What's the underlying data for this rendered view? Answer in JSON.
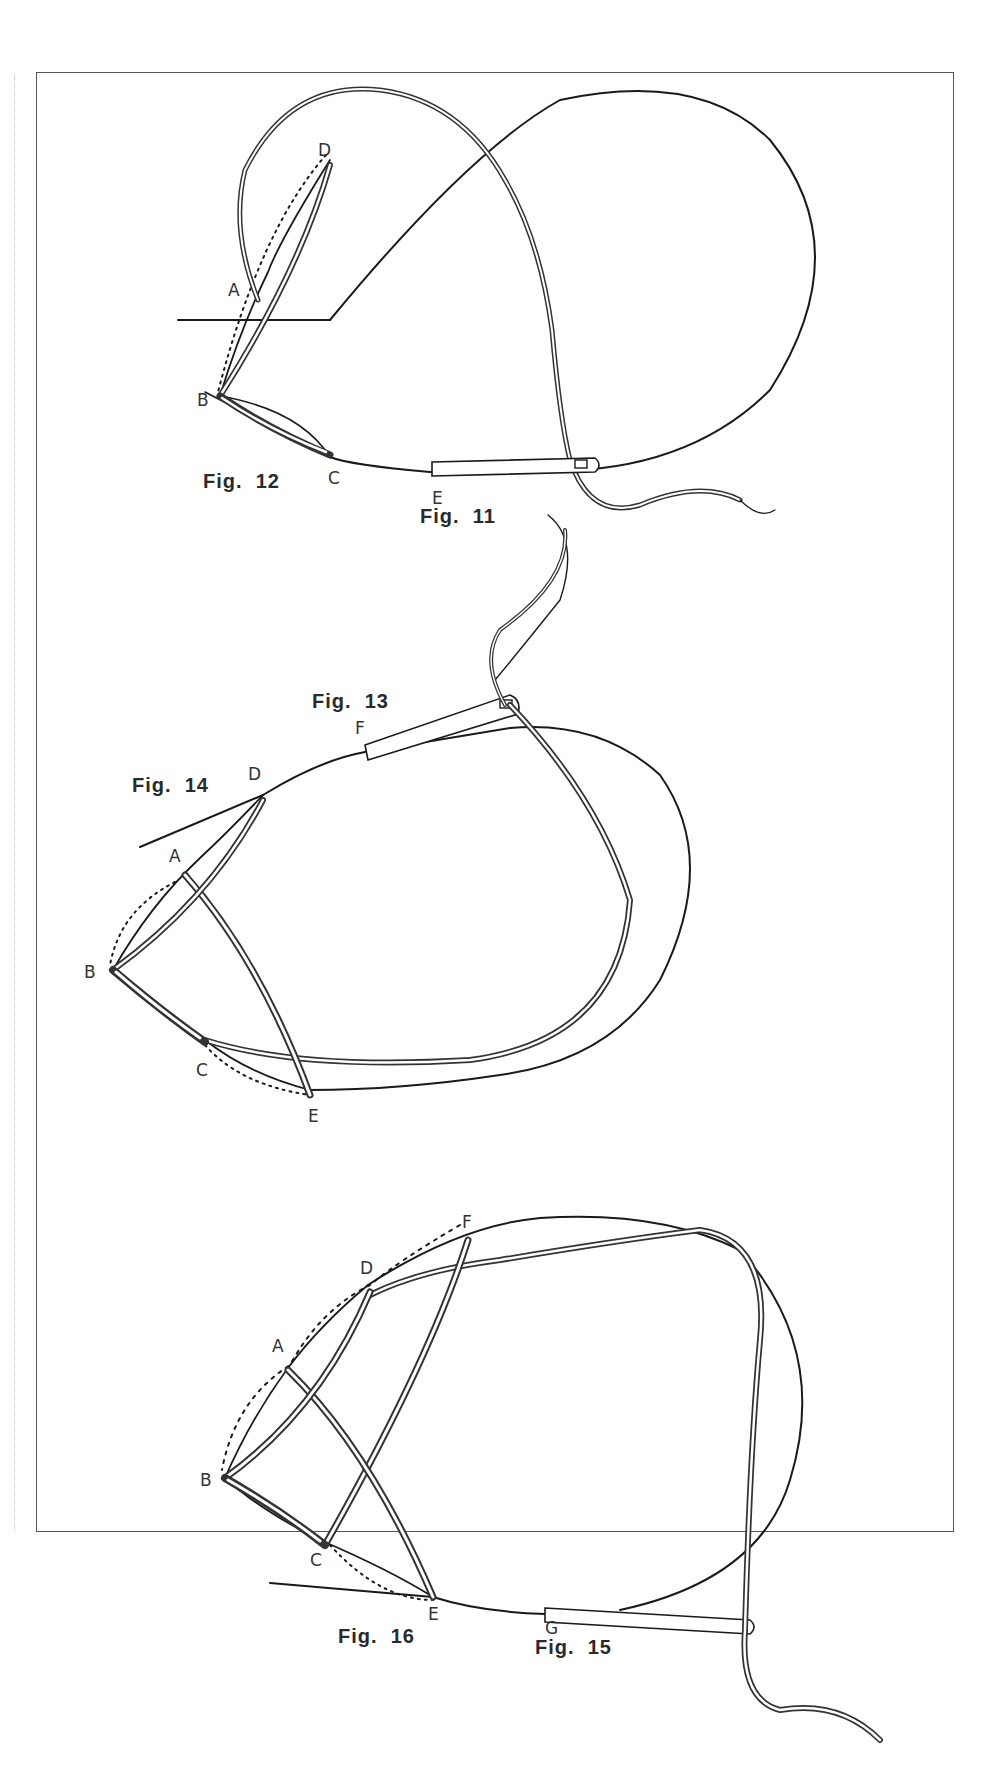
{
  "figures": [
    {
      "id": "fig11",
      "label": "Fig.  11"
    },
    {
      "id": "fig12",
      "label": "Fig.  12"
    },
    {
      "id": "fig13",
      "label": "Fig.  13"
    },
    {
      "id": "fig14",
      "label": "Fig.  14"
    },
    {
      "id": "fig15",
      "label": "Fig.  15"
    },
    {
      "id": "fig16",
      "label": "Fig.  16"
    }
  ],
  "points": {
    "top": {
      "A": "A",
      "B": "B",
      "C": "C",
      "D": "D",
      "E": "E"
    },
    "middle": {
      "A": "A",
      "B": "B",
      "C": "C",
      "D": "D",
      "E": "E",
      "F": "F"
    },
    "bottom": {
      "A": "A",
      "B": "B",
      "C": "C",
      "D": "D",
      "E": "E",
      "F": "F",
      "G": "G"
    }
  },
  "colors": {
    "ink": "#1a1a1a",
    "frame": "#555555",
    "paper": "#ffffff"
  }
}
